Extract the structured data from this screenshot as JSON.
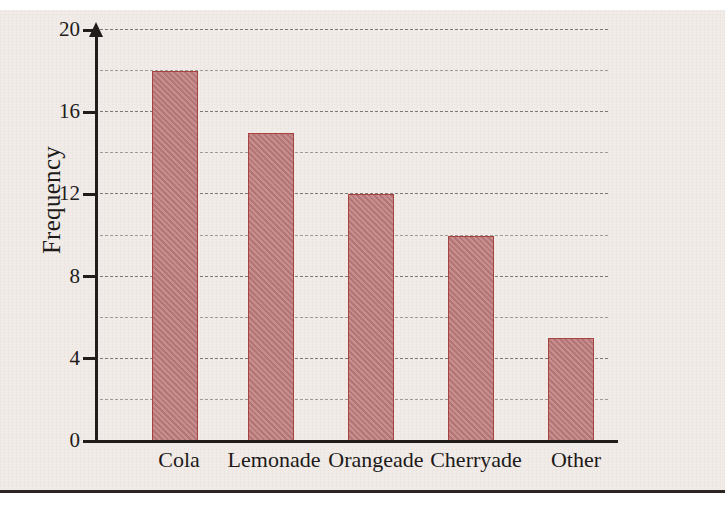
{
  "chart_data": {
    "type": "bar",
    "title": "",
    "subtitle": "",
    "xlabel": "",
    "ylabel": "Frequency",
    "categories": [
      "Cola",
      "Lemonade",
      "Orangeade",
      "Cherryade",
      "Other"
    ],
    "values": [
      18,
      15,
      12,
      10,
      5
    ],
    "series": [
      {
        "name": "Frequency",
        "values": [
          18,
          15,
          12,
          10,
          5
        ]
      }
    ],
    "ylim": [
      0,
      20
    ],
    "y_tick_labels": [
      "0",
      "4",
      "8",
      "12",
      "16",
      "20"
    ],
    "y_tick_values": [
      0,
      4,
      8,
      12,
      16,
      20
    ],
    "y_gridline_values": [
      2,
      4,
      6,
      8,
      10,
      12,
      14,
      16,
      18,
      20
    ],
    "grid": true,
    "grid_axis": "y",
    "legend": false,
    "legend_position": "none",
    "annotations": [],
    "colors": {
      "bar_fill": "#bd7b7b",
      "bar_stroke": "#a8413f",
      "axis": "#231c1a",
      "gridline": "#9a9694",
      "paper": "#f2ece9",
      "text": "#201a18"
    }
  },
  "axis": {
    "y_title": "Frequency"
  },
  "ticks": {
    "t0": "0",
    "t4": "4",
    "t8": "8",
    "t12": "12",
    "t16": "16",
    "t20": "20"
  },
  "categories": {
    "c0": "Cola",
    "c1": "Lemonade",
    "c2": "Orangeade",
    "c3": "Cherryade",
    "c4": "Other"
  }
}
